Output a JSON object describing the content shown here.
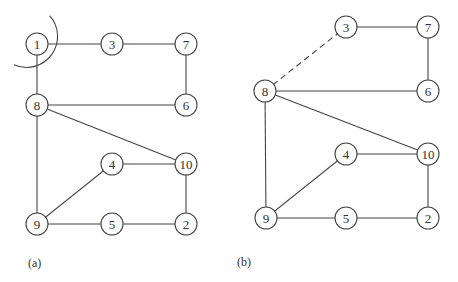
{
  "panels": [
    {
      "id": "a",
      "label": "(a)",
      "label_pos": [
        28,
        267
      ],
      "nodes": [
        {
          "id": "1",
          "label": "1",
          "x": 37,
          "y": 44
        },
        {
          "id": "3",
          "label": "3",
          "x": 112,
          "y": 44
        },
        {
          "id": "7",
          "label": "7",
          "x": 186,
          "y": 44
        },
        {
          "id": "8",
          "label": "8",
          "x": 37,
          "y": 105
        },
        {
          "id": "6",
          "label": "6",
          "x": 186,
          "y": 105
        },
        {
          "id": "4",
          "label": "4",
          "x": 112,
          "y": 164
        },
        {
          "id": "10",
          "label": "10",
          "x": 186,
          "y": 164
        },
        {
          "id": "9",
          "label": "9",
          "x": 37,
          "y": 224
        },
        {
          "id": "5",
          "label": "5",
          "x": 112,
          "y": 224
        },
        {
          "id": "2",
          "label": "2",
          "x": 186,
          "y": 224
        }
      ],
      "edges": [
        {
          "from": "1",
          "to": "3",
          "style": "solid"
        },
        {
          "from": "3",
          "to": "7",
          "style": "solid"
        },
        {
          "from": "7",
          "to": "6",
          "style": "solid"
        },
        {
          "from": "1",
          "to": "8",
          "style": "solid"
        },
        {
          "from": "8",
          "to": "6",
          "style": "solid"
        },
        {
          "from": "8",
          "to": "10",
          "style": "solid"
        },
        {
          "from": "8",
          "to": "9",
          "style": "solid"
        },
        {
          "from": "9",
          "to": "4",
          "style": "solid"
        },
        {
          "from": "4",
          "to": "10",
          "style": "solid"
        },
        {
          "from": "10",
          "to": "2",
          "style": "solid"
        },
        {
          "from": "9",
          "to": "5",
          "style": "solid"
        },
        {
          "from": "5",
          "to": "2",
          "style": "solid"
        }
      ],
      "cut_arc": {
        "around": "1",
        "radius": 31
      }
    },
    {
      "id": "b",
      "label": "(b)",
      "label_pos": [
        237,
        266
      ],
      "nodes": [
        {
          "id": "3",
          "label": "3",
          "x": 346,
          "y": 27
        },
        {
          "id": "7",
          "label": "7",
          "x": 428,
          "y": 27
        },
        {
          "id": "8",
          "label": "8",
          "x": 265,
          "y": 91
        },
        {
          "id": "6",
          "label": "6",
          "x": 428,
          "y": 91
        },
        {
          "id": "4",
          "label": "4",
          "x": 346,
          "y": 154
        },
        {
          "id": "10",
          "label": "10",
          "x": 428,
          "y": 154
        },
        {
          "id": "9",
          "label": "9",
          "x": 266,
          "y": 218
        },
        {
          "id": "5",
          "label": "5",
          "x": 346,
          "y": 218
        },
        {
          "id": "2",
          "label": "2",
          "x": 428,
          "y": 218
        }
      ],
      "edges": [
        {
          "from": "8",
          "to": "3",
          "style": "dashed"
        },
        {
          "from": "3",
          "to": "7",
          "style": "solid"
        },
        {
          "from": "7",
          "to": "6",
          "style": "solid"
        },
        {
          "from": "8",
          "to": "6",
          "style": "solid"
        },
        {
          "from": "8",
          "to": "10",
          "style": "solid"
        },
        {
          "from": "8",
          "to": "9",
          "style": "solid"
        },
        {
          "from": "9",
          "to": "4",
          "style": "solid"
        },
        {
          "from": "4",
          "to": "10",
          "style": "solid"
        },
        {
          "from": "10",
          "to": "2",
          "style": "solid"
        },
        {
          "from": "9",
          "to": "5",
          "style": "solid"
        },
        {
          "from": "5",
          "to": "2",
          "style": "solid"
        }
      ]
    }
  ],
  "node_radius": 11
}
